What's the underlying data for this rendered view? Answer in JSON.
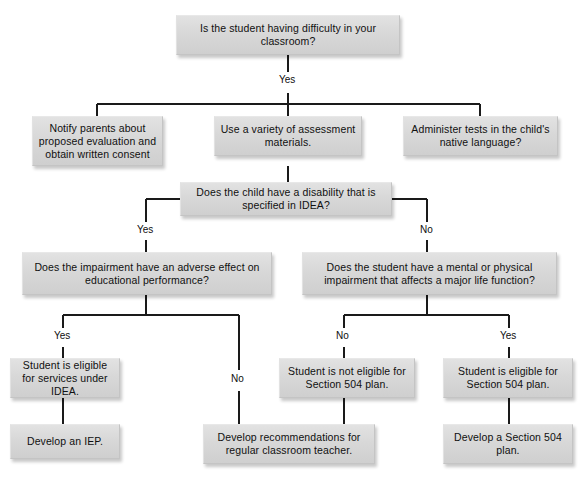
{
  "diagram": {
    "type": "flowchart",
    "colors": {
      "node_fill": "#d8d8d8",
      "node_border": "#c4c4c4",
      "line": "#1a1a1a",
      "text": "#101010",
      "background": "#ffffff"
    },
    "nodes": [
      {
        "id": "n1",
        "label": "Is the student having difficulty in your classroom?"
      },
      {
        "id": "n2",
        "label": "Notify parents about proposed evaluation and obtain written consent"
      },
      {
        "id": "n3",
        "label": "Use a variety of assessment materials."
      },
      {
        "id": "n4",
        "label": "Administer tests in the child's native language?"
      },
      {
        "id": "n5",
        "label": "Does the child have a disability that is specified in IDEA?"
      },
      {
        "id": "n6",
        "label": "Does the impairment have an adverse effect on educational performance?"
      },
      {
        "id": "n7",
        "label": "Does the student have a mental or physical impairment that affects a major life function?"
      },
      {
        "id": "n8",
        "label": "Student is eligible for services under IDEA."
      },
      {
        "id": "n9",
        "label": "Student is not eligible for Section 504 plan."
      },
      {
        "id": "n10",
        "label": "Student is eligible for Section 504 plan."
      },
      {
        "id": "n11",
        "label": "Develop an IEP."
      },
      {
        "id": "n12",
        "label": "Develop recommendations for regular classroom teacher."
      },
      {
        "id": "n13",
        "label": "Develop a Section 504 plan."
      }
    ],
    "edge_labels": [
      {
        "id": "e1",
        "text": "Yes"
      },
      {
        "id": "e2",
        "text": "Yes"
      },
      {
        "id": "e3",
        "text": "No"
      },
      {
        "id": "e4",
        "text": "Yes"
      },
      {
        "id": "e5",
        "text": "No"
      },
      {
        "id": "e6",
        "text": "No"
      },
      {
        "id": "e7",
        "text": "Yes"
      }
    ]
  }
}
